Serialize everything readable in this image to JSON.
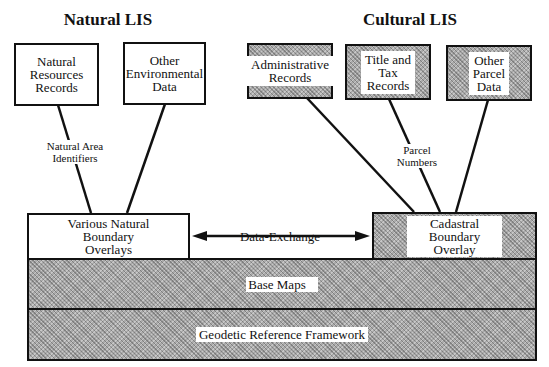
{
  "titles": {
    "natural": "Natural  LIS",
    "cultural": "Cultural  LIS"
  },
  "natural_boxes": [
    {
      "label": "Natural\nResources\nRecords"
    },
    {
      "label": "Other\nEnvironmental\nData"
    }
  ],
  "cultural_boxes": [
    {
      "label": "Administrative\nRecords"
    },
    {
      "label": "Title and\nTax\nRecords"
    },
    {
      "label": "Other\nParcel\nData"
    }
  ],
  "connector_labels": {
    "natural": "Natural Area\nIdentifiers",
    "cultural": "Parcel\nNumbers"
  },
  "overlays": {
    "natural": "Various Natural\nBoundary\nOverlays",
    "exchange": "Data-Exchange\nConventions",
    "cadastral": "Cadastral\nBoundary\nOverlay"
  },
  "layers": {
    "base_maps": "Base Maps",
    "geodetic": "Geodetic Reference Framework"
  },
  "colors": {
    "line": "#111111",
    "hatch": "#aaaaaa"
  }
}
